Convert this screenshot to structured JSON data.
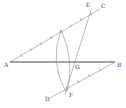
{
  "diagram": {
    "type": "geometric-construction",
    "colors": {
      "line": "#333333",
      "construction": "#777777",
      "label": "#444444",
      "background": "#ffffff"
    },
    "points": [
      {
        "name": "A",
        "x": 10,
        "y": 62,
        "label": "A"
      },
      {
        "name": "B",
        "x": 115,
        "y": 62,
        "label": "B"
      },
      {
        "name": "C",
        "x": 100,
        "y": 8,
        "label": "C"
      },
      {
        "name": "E",
        "x": 91,
        "y": 10,
        "label": "E"
      },
      {
        "name": "G",
        "x": 74,
        "y": 62,
        "label": "G"
      },
      {
        "name": "F",
        "x": 67,
        "y": 90,
        "label": "F"
      },
      {
        "name": "D",
        "x": 50,
        "y": 98,
        "label": "D"
      }
    ],
    "segments": [
      {
        "from": "A",
        "to": "B",
        "style": "main"
      },
      {
        "from": "A",
        "to": "C",
        "style": "construction"
      },
      {
        "from": "D",
        "to": "B",
        "style": "construction"
      },
      {
        "from": "E",
        "to": "F",
        "style": "construction"
      }
    ],
    "labels": {
      "A": "A",
      "B": "B",
      "C": "C",
      "D": "D",
      "E": "E",
      "F": "F",
      "G": "G"
    }
  }
}
